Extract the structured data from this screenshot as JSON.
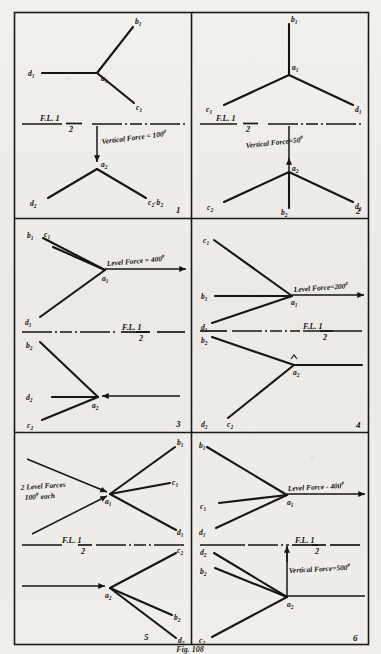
{
  "plate": {
    "title": "Force Diagrams Plate",
    "caption": "Fig. 108",
    "background_color": "#efeeea",
    "ink_color": "#161614",
    "grid": {
      "columns": 2,
      "rows": 3,
      "panel_count": 6
    }
  },
  "floor_line": {
    "label_main": "F.L.",
    "label_numerator": "1",
    "label_denominator": "2",
    "style": "dash-dot"
  },
  "panels": [
    {
      "number": "1",
      "force": {
        "text": "Vertical Force = 100",
        "unit_symbol": "#",
        "direction": "down",
        "magnitude": 100,
        "type": "vertical"
      },
      "upper_joint": {
        "node": "a",
        "node_sub": "1"
      },
      "lower_joint": {
        "node": "a",
        "node_sub": "2"
      },
      "upper_members": [
        {
          "label": "b",
          "label_sub": "1"
        },
        {
          "label": "d",
          "label_sub": "1"
        },
        {
          "label": "c",
          "label_sub": "1"
        }
      ],
      "lower_members": [
        {
          "label": "d",
          "label_sub": "2"
        },
        {
          "label": "c₂-b₂",
          "label_sub": ""
        }
      ]
    },
    {
      "number": "2",
      "force": {
        "text": "Vertical Force=50",
        "unit_symbol": "#",
        "direction": "up",
        "magnitude": 50,
        "type": "vertical"
      },
      "upper_joint": {
        "node": "a",
        "node_sub": "1"
      },
      "lower_joint": {
        "node": "a",
        "node_sub": "2"
      },
      "upper_members": [
        {
          "label": "b",
          "label_sub": "1"
        },
        {
          "label": "c",
          "label_sub": "1"
        },
        {
          "label": "d",
          "label_sub": "1"
        }
      ],
      "lower_members": [
        {
          "label": "c",
          "label_sub": "2"
        },
        {
          "label": "b",
          "label_sub": "2"
        },
        {
          "label": "d",
          "label_sub": "2"
        }
      ]
    },
    {
      "number": "3",
      "force": {
        "text": "Level Force = 400",
        "unit_symbol": "#",
        "direction": "right",
        "magnitude": 400,
        "type": "level"
      },
      "upper_joint": {
        "node": "a",
        "node_sub": "1"
      },
      "lower_joint": {
        "node": "a",
        "node_sub": "2"
      },
      "upper_members": [
        {
          "label": "b",
          "label_sub": "1"
        },
        {
          "label": "c",
          "label_sub": "1"
        },
        {
          "label": "d",
          "label_sub": "1"
        }
      ],
      "lower_members": [
        {
          "label": "b",
          "label_sub": "2"
        },
        {
          "label": "d",
          "label_sub": "2"
        },
        {
          "label": "c",
          "label_sub": "2"
        }
      ]
    },
    {
      "number": "4",
      "force": {
        "text": "Level Force=200",
        "unit_symbol": "#",
        "direction": "right",
        "magnitude": 200,
        "type": "level"
      },
      "upper_joint": {
        "node": "a",
        "node_sub": "1"
      },
      "lower_joint": {
        "node": "a",
        "node_sub": "2"
      },
      "upper_members": [
        {
          "label": "c",
          "label_sub": "1"
        },
        {
          "label": "b",
          "label_sub": "1"
        },
        {
          "label": "d",
          "label_sub": "1"
        }
      ],
      "lower_members": [
        {
          "label": "b",
          "label_sub": "2"
        },
        {
          "label": "d",
          "label_sub": "2"
        },
        {
          "label": "c",
          "label_sub": "2"
        }
      ]
    },
    {
      "number": "5",
      "force": {
        "text_line1": "2 Level Forces",
        "text_line2": "100",
        "unit_symbol": "#",
        "text_line2_tail": "each",
        "magnitude": 100,
        "count": 2,
        "type": "level"
      },
      "upper_joint": {
        "node": "a",
        "node_sub": "1"
      },
      "lower_joint": {
        "node": "a",
        "node_sub": "2"
      },
      "upper_members": [
        {
          "label": "b",
          "label_sub": "1"
        },
        {
          "label": "c",
          "label_sub": "1"
        },
        {
          "label": "d",
          "label_sub": "1"
        }
      ],
      "lower_members": [
        {
          "label": "c",
          "label_sub": "2"
        },
        {
          "label": "b",
          "label_sub": "2"
        },
        {
          "label": "d",
          "label_sub": "2"
        }
      ]
    },
    {
      "number": "6",
      "force_level": {
        "text": "Level Force - 400",
        "unit_symbol": "#",
        "direction": "right",
        "magnitude": 400,
        "type": "level"
      },
      "force_vertical": {
        "text": "Vertical Force=500",
        "unit_symbol": "#",
        "direction": "up",
        "magnitude": 500,
        "type": "vertical"
      },
      "upper_joint": {
        "node": "a",
        "node_sub": "1"
      },
      "lower_joint": {
        "node": "a",
        "node_sub": "2"
      },
      "upper_members": [
        {
          "label": "b",
          "label_sub": "1"
        },
        {
          "label": "c",
          "label_sub": "1"
        },
        {
          "label": "d",
          "label_sub": "1"
        }
      ],
      "lower_members": [
        {
          "label": "d",
          "label_sub": "2"
        },
        {
          "label": "b",
          "label_sub": "2"
        },
        {
          "label": "c",
          "label_sub": "2"
        }
      ]
    }
  ]
}
